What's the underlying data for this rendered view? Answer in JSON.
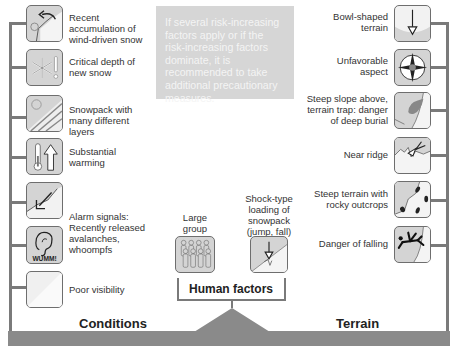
{
  "info_box": {
    "text": "If several risk-increasing factors apply or if the risk-increasing factors dominate, it is recommended to take additional precautionary measures."
  },
  "conditions": {
    "title": "Conditions",
    "items": [
      {
        "label": "Recent accumulation of wind-driven snow",
        "icon": "wind-drifted-snow-icon"
      },
      {
        "label": "Critical depth of new snow",
        "icon": "snowflake-warning-icon"
      },
      {
        "label": "Snowpack with many different layers",
        "icon": "snow-layers-icon"
      },
      {
        "label": "Substantial warming",
        "icon": "thermometer-rising-icon"
      },
      {
        "label": "Alarm signals: Recently released avalanches, whoompfs",
        "icon": "avalanche-release-icon"
      },
      {
        "label": "",
        "icon": "ear-wumm-icon",
        "badge": "WUMM!"
      },
      {
        "label": "Poor visibility",
        "icon": "poor-visibility-icon"
      }
    ]
  },
  "terrain": {
    "title": "Terrain",
    "items": [
      {
        "label": "Bowl-shaped terrain",
        "icon": "bowl-terrain-icon"
      },
      {
        "label": "Unfavorable aspect",
        "icon": "compass-icon"
      },
      {
        "label": "Steep slope above, terrain trap: danger of deep burial",
        "icon": "terrain-trap-icon"
      },
      {
        "label": "Near ridge",
        "icon": "ridge-icon"
      },
      {
        "label": "Steep terrain with rocky outcrops",
        "icon": "rocky-outcrops-icon"
      },
      {
        "label": "Danger of falling",
        "icon": "falling-person-icon"
      }
    ]
  },
  "human_factors": {
    "title": "Human factors",
    "items": [
      {
        "label": "Large group",
        "icon": "group-icon"
      },
      {
        "label": "Shock-type loading of snowpack (jump, fall)",
        "icon": "shock-loading-icon"
      }
    ]
  },
  "colors": {
    "line": "#7a7a7a",
    "icon_bg": "#d4d4d4",
    "info_bg": "#d6d6d6",
    "bar": "#8a8a8a"
  }
}
